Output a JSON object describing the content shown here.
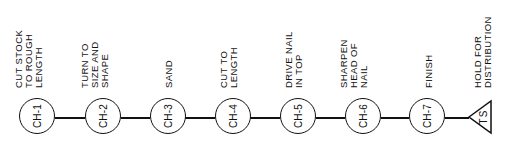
{
  "diagram": {
    "type": "process-flow-chart",
    "orientation": "horizontal, labels rotated -90deg",
    "steps": [
      {
        "id": "CH-1",
        "shape": "circle",
        "description": [
          "CUT STOCK",
          "TO ROUGH",
          "LENGTH"
        ]
      },
      {
        "id": "CH-2",
        "shape": "circle",
        "description": [
          "TURN TO",
          "SIZE AND",
          "SHAPE"
        ]
      },
      {
        "id": "CH-3",
        "shape": "circle",
        "description": [
          "SAND"
        ]
      },
      {
        "id": "CH-4",
        "shape": "circle",
        "description": [
          "CUT TO",
          "LENGTH"
        ]
      },
      {
        "id": "CH-5",
        "shape": "circle",
        "description": [
          "DRIVE NAIL",
          "IN TOP"
        ]
      },
      {
        "id": "CH-6",
        "shape": "circle",
        "description": [
          "SHARPEN",
          "HEAD OF",
          "NAIL"
        ]
      },
      {
        "id": "CH-7",
        "shape": "circle",
        "description": [
          "FINISH"
        ]
      },
      {
        "id": "TS",
        "shape": "triangle",
        "description": [
          "HOLD FOR",
          "DISTRIBUTION"
        ]
      }
    ],
    "colors": {
      "line": "#111111",
      "background": "#ffffff"
    }
  }
}
